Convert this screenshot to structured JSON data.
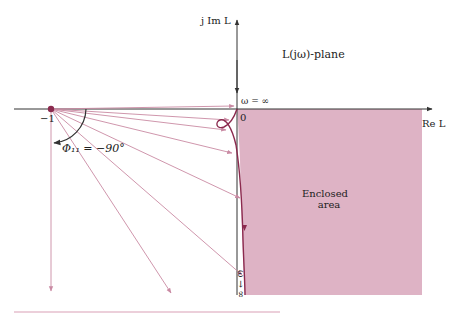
{
  "diagram": {
    "type": "nyquist-plot",
    "labels": {
      "imag_axis": "j Im L",
      "real_axis": "Re L",
      "plane": "L(jω)-plane",
      "omega_inf_top": "ω = ∞",
      "origin": "0",
      "minus_one": "−1",
      "phase": "Φ₁₁ = −90°",
      "enclosed_line1": "Enclosed",
      "enclosed_line2": "area",
      "omega_inf_bottom": "ω → ∞"
    },
    "colors": {
      "fill": "#d8a6bb",
      "curve": "#8b2a4e",
      "arrows": "#c98aa3",
      "axes": "#333333"
    }
  }
}
